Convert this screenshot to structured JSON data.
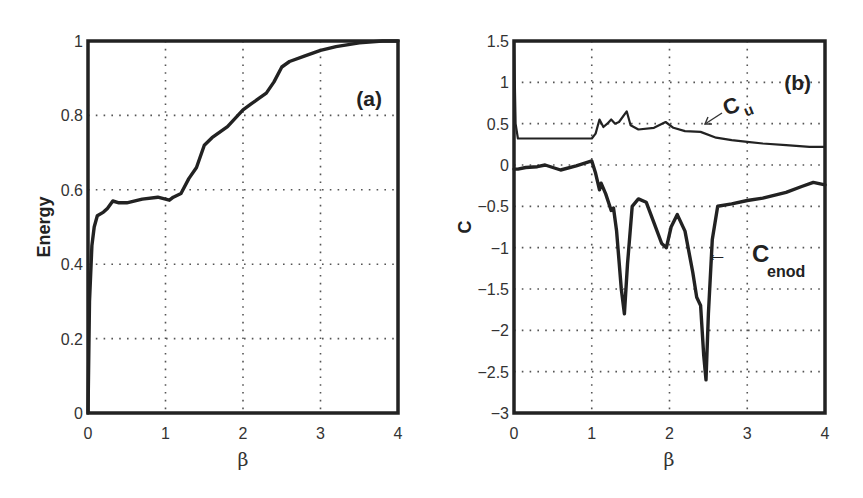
{
  "chart_data": [
    {
      "type": "line",
      "panel_label": "(a)",
      "title": "",
      "xlabel": "β",
      "ylabel": "Energy",
      "xlim": [
        0,
        4
      ],
      "ylim": [
        0,
        1
      ],
      "xticks": [
        "0",
        "1",
        "2",
        "3",
        "4"
      ],
      "yticks": [
        "0",
        "0.2",
        "0.4",
        "0.6",
        "0.8",
        "1"
      ],
      "grid": true,
      "series": [
        {
          "name": "Energy",
          "x": [
            0,
            0.02,
            0.05,
            0.08,
            0.12,
            0.2,
            0.25,
            0.32,
            0.4,
            0.5,
            0.7,
            0.9,
            1.0,
            1.05,
            1.1,
            1.2,
            1.3,
            1.4,
            1.5,
            1.6,
            1.8,
            2.0,
            2.1,
            2.2,
            2.3,
            2.4,
            2.5,
            2.6,
            2.8,
            3.0,
            3.2,
            3.5,
            3.8,
            4.0
          ],
          "values": [
            0,
            0.3,
            0.45,
            0.5,
            0.53,
            0.54,
            0.55,
            0.57,
            0.565,
            0.565,
            0.575,
            0.58,
            0.575,
            0.572,
            0.58,
            0.59,
            0.63,
            0.66,
            0.72,
            0.74,
            0.77,
            0.815,
            0.83,
            0.845,
            0.86,
            0.89,
            0.93,
            0.945,
            0.96,
            0.975,
            0.985,
            0.995,
            1.0,
            1.0
          ]
        }
      ]
    },
    {
      "type": "line",
      "panel_label": "(b)",
      "title": "",
      "xlabel": "β",
      "ylabel": "C",
      "xlim": [
        0,
        4
      ],
      "ylim": [
        -3,
        1.5
      ],
      "xticks": [
        "0",
        "1",
        "2",
        "3",
        "4"
      ],
      "yticks": [
        "−3",
        "−2.5",
        "−2",
        "−1.5",
        "−1",
        "−0.5",
        "0",
        "0.5",
        "1",
        "1.5"
      ],
      "grid": true,
      "annotations": [
        {
          "text": "C",
          "subscript": "u",
          "arrow": "←",
          "points_to": [
            2.45,
            0.42
          ]
        },
        {
          "text": "C",
          "subscript": "enod",
          "arrow": "←",
          "points_to": [
            2.6,
            -1.05
          ]
        }
      ],
      "series": [
        {
          "name": "C_u",
          "x": [
            0,
            0.02,
            0.05,
            0.5,
            1.0,
            1.05,
            1.1,
            1.15,
            1.2,
            1.25,
            1.3,
            1.35,
            1.45,
            1.5,
            1.6,
            1.8,
            1.95,
            2.05,
            2.2,
            2.4,
            2.6,
            2.8,
            3.0,
            3.2,
            3.5,
            3.8,
            4.0
          ],
          "values": [
            1.5,
            0.5,
            0.32,
            0.32,
            0.32,
            0.38,
            0.55,
            0.46,
            0.5,
            0.55,
            0.5,
            0.52,
            0.65,
            0.48,
            0.43,
            0.45,
            0.52,
            0.45,
            0.41,
            0.4,
            0.33,
            0.3,
            0.28,
            0.26,
            0.24,
            0.22,
            0.22
          ]
        },
        {
          "name": "C_enod",
          "x": [
            0,
            0.05,
            0.15,
            0.3,
            0.4,
            0.6,
            0.8,
            1.0,
            1.05,
            1.1,
            1.12,
            1.18,
            1.25,
            1.28,
            1.32,
            1.38,
            1.42,
            1.46,
            1.52,
            1.6,
            1.7,
            1.8,
            1.9,
            1.96,
            2.02,
            2.1,
            2.2,
            2.3,
            2.35,
            2.4,
            2.44,
            2.47,
            2.5,
            2.55,
            2.62,
            2.8,
            3.0,
            3.2,
            3.5,
            3.7,
            3.85,
            4.0
          ],
          "values": [
            -0.05,
            -0.05,
            -0.03,
            -0.02,
            0.0,
            -0.06,
            -0.01,
            0.05,
            -0.1,
            -0.3,
            -0.22,
            -0.35,
            -0.55,
            -0.52,
            -0.8,
            -1.5,
            -1.8,
            -1.2,
            -0.5,
            -0.41,
            -0.45,
            -0.7,
            -0.95,
            -1.0,
            -0.75,
            -0.6,
            -0.8,
            -1.3,
            -1.6,
            -1.7,
            -2.3,
            -2.6,
            -1.8,
            -0.9,
            -0.5,
            -0.47,
            -0.43,
            -0.4,
            -0.33,
            -0.26,
            -0.21,
            -0.24
          ]
        }
      ]
    }
  ]
}
